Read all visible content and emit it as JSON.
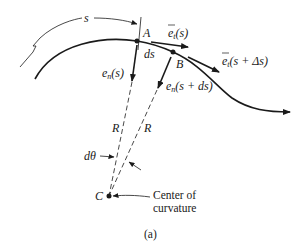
{
  "figure": {
    "caption": "(a)",
    "arc_length_label": "s",
    "points": {
      "A": "A",
      "B": "B",
      "C": "C"
    },
    "segment_label": "ds",
    "tangent_A": {
      "base": "e",
      "sub": "t",
      "arg": "(s)"
    },
    "tangent_B": {
      "base": "e",
      "sub": "t",
      "arg": "(s + Δs)"
    },
    "normal_A": {
      "base": "e",
      "sub": "n",
      "arg": "(s)"
    },
    "normal_B": {
      "base": "e",
      "sub": "n",
      "arg": "(s + ds)"
    },
    "radius_label_1": "R",
    "radius_label_2": "R",
    "angle_label": "dθ",
    "center_label_line1": "Center of",
    "center_label_line2": "curvature"
  },
  "colors": {
    "ink": "#1a1a1a",
    "background": "#ffffff"
  }
}
